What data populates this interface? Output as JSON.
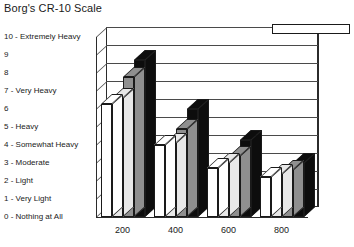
{
  "chart_data": {
    "type": "bar",
    "title": "Borg's CR-10 Scale",
    "xlabel": "",
    "ylabel": "Borg's CR-10 Scale",
    "ylim": [
      0,
      10
    ],
    "grid": true,
    "legend_position": "top-right",
    "categories": [
      "200",
      "400",
      "600",
      "800"
    ],
    "ytick_labels": [
      "10 - Extremely Heavy",
      "9",
      "8",
      "7 - Very Heavy",
      "6",
      "5 - Heavy",
      "4 - Somewhat Heavy",
      "3 - Moderate",
      "2 - Light",
      "1 - Very Light",
      "0 - Nothing at All"
    ],
    "ytick_values": [
      10,
      9,
      8,
      7,
      6,
      5,
      4,
      3,
      2,
      1,
      0
    ],
    "series": [
      {
        "name": "55-lb Lift",
        "color": "#ffffff",
        "values": [
          6.3,
          4.0,
          2.7,
          2.2
        ]
      },
      {
        "name": "65-lb Lift",
        "color": "#e8e8e8",
        "values": [
          6.6,
          4.1,
          3.0,
          2.4
        ]
      },
      {
        "name": "75-lb Lift",
        "color": "#8f8f8f",
        "values": [
          7.8,
          4.9,
          3.4,
          2.6
        ]
      },
      {
        "name": "85-lb Lift",
        "color": "#0d0d0d",
        "values": [
          8.7,
          6.0,
          4.3,
          3.0
        ]
      }
    ]
  }
}
